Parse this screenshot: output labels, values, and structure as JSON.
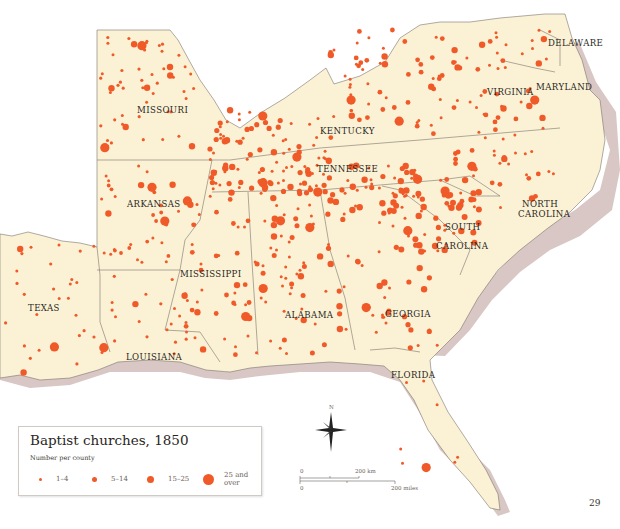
{
  "map": {
    "title": "Baptist churches, 1850",
    "colors": {
      "land": "#fbf2d6",
      "water_shadow": "#d8c7c4",
      "border": "#7a746c",
      "dot": "#f05a28",
      "background": "#ffffff"
    },
    "state_labels": [
      {
        "name": "MISSOURI",
        "x": 137,
        "y": 113
      },
      {
        "name": "KENTUCKY",
        "x": 320,
        "y": 134
      },
      {
        "name": "VIRGINIA",
        "x": 487,
        "y": 95
      },
      {
        "name": "DELAWARE",
        "x": 548,
        "y": 46
      },
      {
        "name": "MARYLAND",
        "x": 536,
        "y": 90
      },
      {
        "name": "TENNESSEE",
        "x": 317,
        "y": 172
      },
      {
        "name": "ARKANSAS",
        "x": 127,
        "y": 207
      },
      {
        "name": "NORTH",
        "x": 522,
        "y": 207
      },
      {
        "name": "CAROLINA",
        "x": 518,
        "y": 217
      },
      {
        "name": "SOUTH",
        "x": 445,
        "y": 230
      },
      {
        "name": "CAROLINA",
        "x": 436,
        "y": 249
      },
      {
        "name": "MISSISSIPPI",
        "x": 180,
        "y": 277
      },
      {
        "name": "TEXAS",
        "x": 28,
        "y": 311
      },
      {
        "name": "ALABAMA",
        "x": 285,
        "y": 318
      },
      {
        "name": "GEORGIA",
        "x": 385,
        "y": 317
      },
      {
        "name": "LOUISIANA",
        "x": 126,
        "y": 360
      },
      {
        "name": "FLORIDA",
        "x": 391,
        "y": 378
      }
    ],
    "page_number": "29"
  },
  "legend": {
    "title": "Baptist churches, 1850",
    "subtitle": "Number per county",
    "items": [
      {
        "label": "1–4",
        "size": 3
      },
      {
        "label": "5–14",
        "size": 5
      },
      {
        "label": "15–25",
        "size": 7
      },
      {
        "label": "25 and over",
        "size": 11
      }
    ]
  },
  "compass": {
    "label": "N"
  },
  "scale_bar": {
    "km_start": "0",
    "km_end": "200 km",
    "miles_start": "0",
    "miles_end": "200 miles"
  }
}
